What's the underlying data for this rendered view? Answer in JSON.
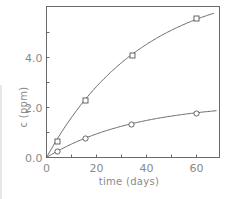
{
  "chart_data": {
    "type": "scatter",
    "title": "",
    "xlabel": "time (days)",
    "ylabel": "c (ppm)",
    "xlim": [
      0,
      69
    ],
    "ylim": [
      0,
      6.0
    ],
    "x_ticks": [
      0,
      10,
      20,
      30,
      40,
      50,
      60
    ],
    "x_tick_labels": [
      "0",
      "",
      "20",
      "",
      "40",
      "",
      "60"
    ],
    "y_ticks": [
      0,
      1,
      2,
      3,
      4,
      5
    ],
    "y_tick_labels": [
      "0.0",
      "",
      "2.0",
      "",
      "4.0",
      ""
    ],
    "grid": false,
    "legend": null,
    "series": [
      {
        "name": "squares",
        "marker": "square",
        "points": [
          {
            "x": 4.4,
            "y": 0.64
          },
          {
            "x": 15.6,
            "y": 2.28
          },
          {
            "x": 34.4,
            "y": 4.08
          },
          {
            "x": 60.0,
            "y": 5.56
          }
        ],
        "fit": {
          "model": "c = a(1 - exp(-k t))",
          "a": 7.0,
          "k": 0.026,
          "t_max": 67
        }
      },
      {
        "name": "circles",
        "marker": "circle",
        "points": [
          {
            "x": 4.4,
            "y": 0.24
          },
          {
            "x": 15.6,
            "y": 0.76
          },
          {
            "x": 34.0,
            "y": 1.32
          },
          {
            "x": 60.0,
            "y": 1.76
          }
        ],
        "fit": {
          "model": "c = a(1 - exp(-k t))",
          "a": 2.2,
          "k": 0.028,
          "t_max": 68
        }
      }
    ]
  },
  "colors": {
    "background": "#ffffff",
    "frame": "#6a6a6a",
    "curve": "#5a5a5a",
    "text": "#8a8a8a"
  }
}
